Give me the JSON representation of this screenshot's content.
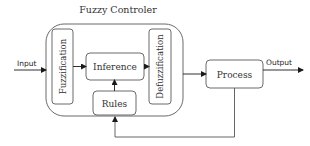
{
  "diagram": {
    "title": "Fuzzy Controler",
    "blocks": {
      "fuzzification": "Fuzzification",
      "inference": "Inference",
      "rules": "Rules",
      "defuzzification": "Defuzzification",
      "process": "Process"
    },
    "signals": {
      "input": "Input",
      "output": "Output"
    },
    "colors": {
      "stroke": "#6b6b6b",
      "arrow": "#1a1a1a",
      "text": "#333333",
      "background": "#ffffff"
    }
  }
}
